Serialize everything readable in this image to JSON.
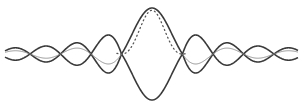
{
  "diagram": {
    "title": "",
    "center_x": 152,
    "baseline_y": 54,
    "amplitude": 46,
    "lobe_width": 30.5,
    "x_start": 5,
    "x_end": 298,
    "curves": [
      {
        "name": "sinc-positive",
        "style": "solid",
        "color": "#3a3a3a"
      },
      {
        "name": "sinc-negative",
        "style": "solid",
        "color": "#3a3a3a"
      },
      {
        "name": "sinc-squared",
        "style": "dotted-center-thin-sides",
        "color": "#555555"
      }
    ]
  }
}
